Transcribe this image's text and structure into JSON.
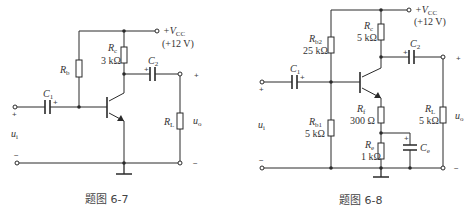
{
  "figures": [
    {
      "caption": "题图 6-7",
      "supply": {
        "label": "+V",
        "sub": "CC",
        "value": "(+12 V)"
      },
      "components": {
        "Rb": {
          "name": "R",
          "sub": "b",
          "value": ""
        },
        "Rc": {
          "name": "R",
          "sub": "c",
          "value": "3 kΩ"
        },
        "C1": {
          "name": "C",
          "sub": "1"
        },
        "C2": {
          "name": "C",
          "sub": "2"
        },
        "RL": {
          "name": "R",
          "sub": "L",
          "value": ""
        }
      },
      "input": {
        "name": "u",
        "sub": "i",
        "plus": "+",
        "minus": "−"
      },
      "output": {
        "name": "u",
        "sub": "o",
        "plus": "+",
        "minus": "−"
      },
      "cap_polarity": "+"
    },
    {
      "caption": "题图 6-8",
      "supply": {
        "label": "+V",
        "sub": "CC",
        "value": "(+12 V)"
      },
      "components": {
        "Rb2": {
          "name": "R",
          "sub": "b2",
          "value": "25 kΩ"
        },
        "Rb1": {
          "name": "R",
          "sub": "b1",
          "value": "5 kΩ"
        },
        "Rc": {
          "name": "R",
          "sub": "c",
          "value": "5 kΩ"
        },
        "Rf": {
          "name": "R",
          "sub": "f",
          "value": "300 Ω"
        },
        "Re": {
          "name": "R",
          "sub": "e",
          "value": "1 kΩ"
        },
        "RL": {
          "name": "R",
          "sub": "L",
          "value": "5 kΩ"
        },
        "C1": {
          "name": "C",
          "sub": "1"
        },
        "C2": {
          "name": "C",
          "sub": "2"
        },
        "Ce": {
          "name": "C",
          "sub": "e"
        }
      },
      "input": {
        "name": "u",
        "sub": "i",
        "plus": "+",
        "minus": "−"
      },
      "output": {
        "name": "u",
        "sub": "o",
        "plus": "+",
        "minus": "−"
      },
      "cap_polarity": "+"
    }
  ]
}
